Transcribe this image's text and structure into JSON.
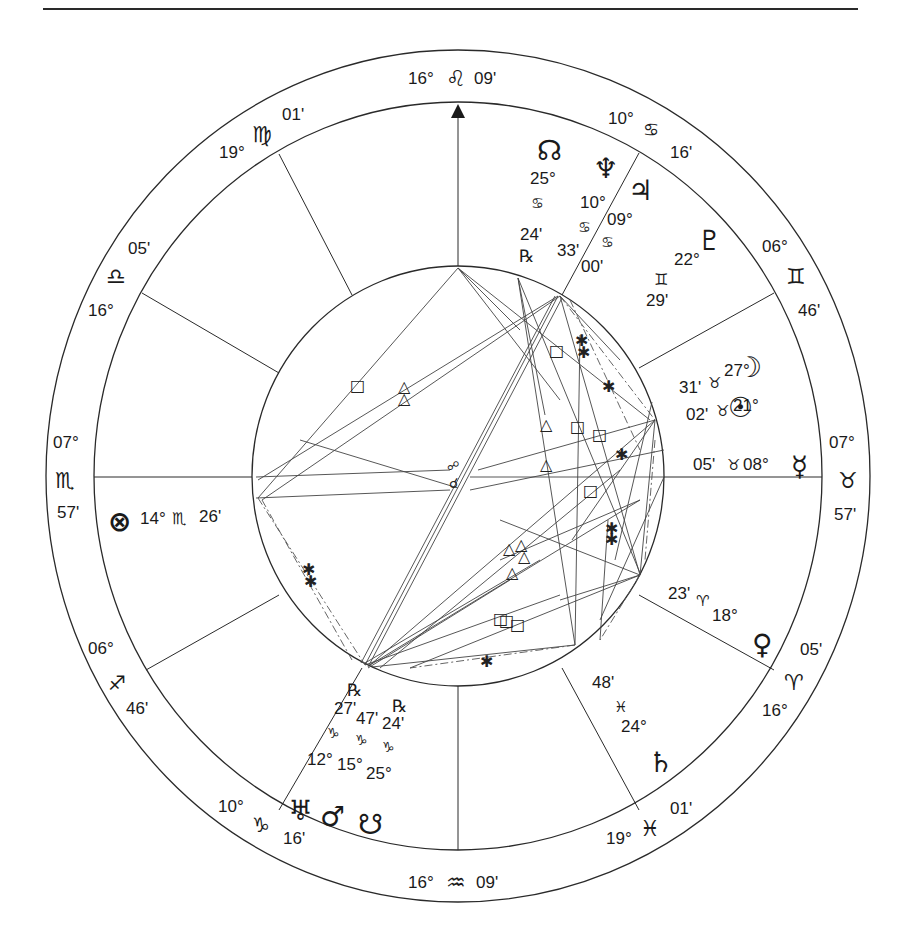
{
  "chart": {
    "type": "natal-wheel",
    "center": [
      458,
      476
    ],
    "outer_radius": [
      412,
      426
    ],
    "middle_radius": [
      364,
      374
    ],
    "inner_radius": [
      206,
      210
    ],
    "line_color": "#2a2a2a"
  },
  "cusps": [
    {
      "id": "mc",
      "deg": "16°",
      "sign": "♌",
      "min": "09'",
      "label": "MC"
    },
    {
      "id": "c11",
      "deg": "10°",
      "sign": "♋",
      "min": "16'"
    },
    {
      "id": "c12",
      "deg": "06°",
      "sign": "♊",
      "min": "46'"
    },
    {
      "id": "dsc",
      "deg": "07°",
      "sign": "♉",
      "min": "57'"
    },
    {
      "id": "c5",
      "deg": "16°",
      "sign": "♈",
      "min": "05'"
    },
    {
      "id": "c6",
      "deg": "19°",
      "sign": "♓",
      "min": "01'"
    },
    {
      "id": "ic",
      "deg": "16°",
      "sign": "♒",
      "min": "09'"
    },
    {
      "id": "c3",
      "deg": "10°",
      "sign": "♑",
      "min": "16'"
    },
    {
      "id": "c2",
      "deg": "06°",
      "sign": "♐",
      "min": "46'"
    },
    {
      "id": "asc",
      "deg": "07°",
      "sign": "♏",
      "min": "57'"
    },
    {
      "id": "c8",
      "deg": "16°",
      "sign": "♎",
      "min": "05'"
    },
    {
      "id": "c9",
      "deg": "19°",
      "sign": "♍",
      "min": "01'"
    }
  ],
  "planets": [
    {
      "id": "north-node",
      "glyph": "☊",
      "deg": "25°",
      "sign": "♋",
      "min": "24'",
      "retro": "℞"
    },
    {
      "id": "neptune",
      "glyph": "♆",
      "deg": "10°",
      "sign": "♋",
      "min": "33'"
    },
    {
      "id": "jupiter",
      "glyph": "♃",
      "deg": "09°",
      "sign": "♋",
      "min": "00'"
    },
    {
      "id": "pluto",
      "glyph": "♇",
      "deg": "22°",
      "sign": "♊",
      "min": "29'"
    },
    {
      "id": "moon",
      "glyph": "☽",
      "deg": "27°",
      "sign": "♉",
      "min": "31'"
    },
    {
      "id": "sun",
      "glyph": "☉",
      "deg": "21°",
      "sign": "♉",
      "min": "02'"
    },
    {
      "id": "mercury",
      "glyph": "☿",
      "deg": "08°",
      "sign": "♉",
      "min": "05'"
    },
    {
      "id": "venus",
      "glyph": "♀",
      "deg": "18°",
      "sign": "♈",
      "min": "23'"
    },
    {
      "id": "saturn",
      "glyph": "♄",
      "deg": "24°",
      "sign": "♓",
      "min": "48'"
    },
    {
      "id": "south-node",
      "glyph": "☋",
      "deg": "25°",
      "sign": "♑",
      "min": "24'",
      "retro": "℞"
    },
    {
      "id": "mars",
      "glyph": "♂",
      "deg": "15°",
      "sign": "♑",
      "min": "47'"
    },
    {
      "id": "uranus",
      "glyph": "♅",
      "deg": "12°",
      "sign": "♑",
      "min": "27'",
      "retro": "℞"
    },
    {
      "id": "part-of-fortune",
      "glyph": "⊗",
      "deg": "14°",
      "sign": "♏",
      "min": "26'"
    }
  ],
  "aspect_symbols": {
    "trine": "△",
    "square": "□",
    "sextile": "✱",
    "opposition": "☍",
    "conjunction": "☌"
  }
}
